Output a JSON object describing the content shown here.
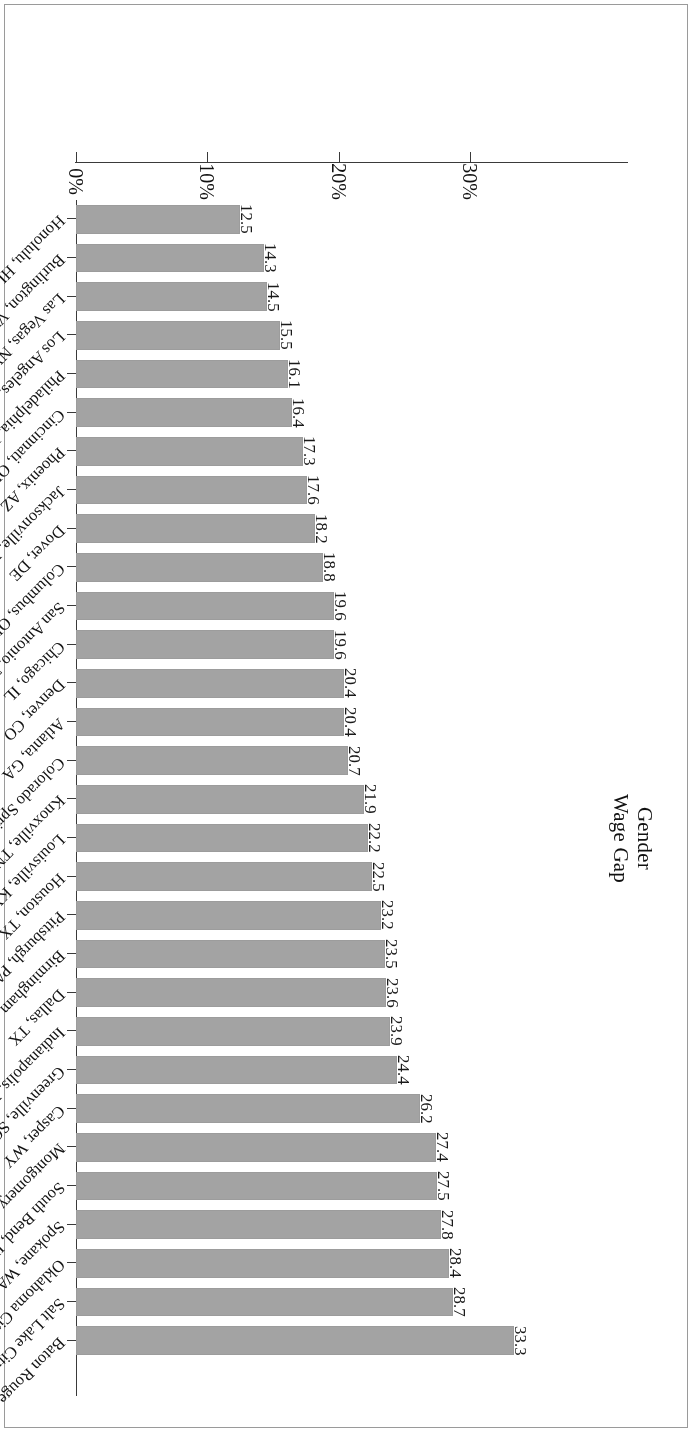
{
  "figure": {
    "orientation": "rotated-180",
    "bar_color": "#a3a3a3",
    "axis_color": "#3a3a3a",
    "frame_color": "#9a9a9a"
  },
  "axis_title": {
    "line1": "Gender",
    "line2": "Wage Gap"
  },
  "chart_data": {
    "type": "bar",
    "title": "",
    "subtitle": "",
    "xlabel": "Gender Wage Gap",
    "ylabel": "",
    "orientation": "horizontal",
    "grid": false,
    "legend": false,
    "xlim": [
      0,
      35
    ],
    "tick_labels": [
      "0%",
      "10%",
      "20%",
      "30%"
    ],
    "tick_values": [
      0,
      10,
      20,
      30
    ],
    "value_suffix": "",
    "categories": [
      "Baton Rouge, LA",
      "Salt Lake City, UT",
      "Oklahoma City, OK",
      "Spokane, WA",
      "South Bend, IN",
      "Montgomery, AL",
      "Casper, WY",
      "Greenville, SC",
      "Indianapolis, IN",
      "Dallas, TX",
      "Birmingham, AL",
      "Pittsburgh, PA",
      "Houston, TX",
      "Louisville, KY",
      "Knoxville, TN",
      "Colorado Springs, CO",
      "Atlanta, GA",
      "Denver, CO",
      "Chicago, IL",
      "San Antonio, TX",
      "Columbus, OH",
      "Dover, DE",
      "Jacksonville, FL",
      "Phoenix, AZ",
      "Cincinnati, OH",
      "Philadelphia, PA",
      "Los Angeles, CA",
      "Las Vegas, NV",
      "Burlington, VT",
      "Honolulu, HI"
    ],
    "values": [
      33.3,
      28.7,
      28.4,
      27.8,
      27.5,
      27.4,
      26.2,
      24.4,
      23.9,
      23.6,
      23.5,
      23.2,
      22.5,
      22.2,
      21.9,
      20.7,
      20.4,
      20.4,
      19.6,
      19.6,
      18.8,
      18.2,
      17.6,
      17.3,
      16.4,
      16.1,
      15.5,
      14.5,
      14.3,
      12.5
    ],
    "data_labels": [
      "33.3",
      "28.7",
      "28.4",
      "27.8",
      "27.5",
      "27.4",
      "26.2",
      "24.4",
      "23.9",
      "23.6",
      "23.5",
      "23.2",
      "22.5",
      "22.2",
      "21.9",
      "20.7",
      "20.4",
      "20.4",
      "19.6",
      "19.6",
      "18.8",
      "18.2",
      "17.6",
      "17.3",
      "16.4",
      "16.1",
      "15.5",
      "14.5",
      "14.3",
      "12.5"
    ]
  }
}
